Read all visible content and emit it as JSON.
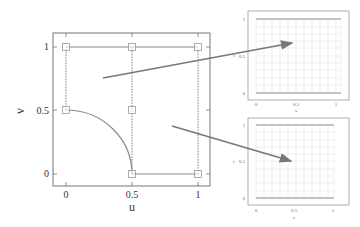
{
  "main_plot": {
    "xlabel": "u",
    "ylabel": "v",
    "x_ticks": [
      "0",
      "0.5",
      "1"
    ],
    "y_ticks": [
      "0",
      "0.5",
      "1"
    ],
    "control_points": [
      {
        "u": 0,
        "v": 1
      },
      {
        "u": 0.5,
        "v": 1
      },
      {
        "u": 1,
        "v": 1
      },
      {
        "u": 0,
        "v": 0.5
      },
      {
        "u": 0.5,
        "v": 0.5
      },
      {
        "u": 0.5,
        "v": 0
      },
      {
        "u": 1,
        "v": 0
      }
    ],
    "curves": [
      {
        "name": "top-edge",
        "from": [
          0,
          1
        ],
        "to": [
          1,
          1
        ],
        "style": "solid"
      },
      {
        "name": "bottom-edge",
        "from": [
          0.5,
          0
        ],
        "to": [
          1,
          0
        ],
        "style": "solid"
      },
      {
        "name": "quarter-arc",
        "from": [
          0,
          0.5
        ],
        "to": [
          0.5,
          0
        ],
        "style": "solid"
      },
      {
        "name": "left-dashed",
        "from": [
          0,
          0.5
        ],
        "to": [
          0,
          1
        ],
        "style": "dashed"
      },
      {
        "name": "middle-dashed",
        "from": [
          0.5,
          0
        ],
        "to": [
          0.5,
          1
        ],
        "style": "dashed"
      },
      {
        "name": "right-dashed",
        "from": [
          1,
          0
        ],
        "to": [
          1,
          1
        ],
        "style": "dashed"
      }
    ]
  },
  "param_plots": [
    {
      "xlabel": "s",
      "ylabel": "t",
      "x_ticks": [
        "0",
        "0.5",
        "1"
      ],
      "y_ticks": [
        "0",
        "0.5",
        "1"
      ]
    },
    {
      "xlabel": "s",
      "ylabel": "t",
      "x_ticks": [
        "0",
        "0.5",
        "1"
      ],
      "y_ticks": [
        "0",
        "0.5",
        "1"
      ]
    }
  ],
  "colors": {
    "frame": "#555555",
    "curve": "#888888",
    "grid": "#dddddd",
    "arrow": "#777777",
    "marker": "#999999"
  }
}
